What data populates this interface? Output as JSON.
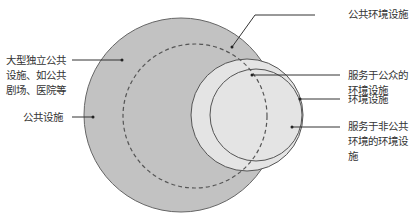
{
  "diagram": {
    "type": "nested-circles",
    "colors": {
      "public_facilities": "#c2c2c2",
      "public_env_facilities_outline": "#555555",
      "env_facilities_public": "#e4e4e4",
      "env_facilities_nonpublic": "#8a8a8a",
      "stroke": "#555555"
    },
    "labels": {
      "large_public": "大型独立公共\n设施、如公共\n剧场、医院等",
      "public_facilities": "公共设施",
      "public_env_facilities": "公共环境设施",
      "env_serving_public": "服务于公众的\n环境设施",
      "env_facilities": "环境设施",
      "env_serving_nonpublic": "服务于非公共\n环境的环境设\n施"
    }
  }
}
